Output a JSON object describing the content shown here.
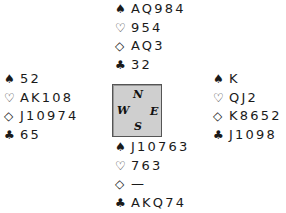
{
  "suits": {
    "spades": "♠",
    "hearts": "♡",
    "diamonds": "◇",
    "clubs": "♣"
  },
  "hands": {
    "north": {
      "spades": "AQ984",
      "hearts": "954",
      "diamonds": "AQ3",
      "clubs": "32"
    },
    "west": {
      "spades": "52",
      "hearts": "AK108",
      "diamonds": "J10974",
      "clubs": "65"
    },
    "east": {
      "spades": "K",
      "hearts": "QJ2",
      "diamonds": "K8652",
      "clubs": "J1098"
    },
    "south": {
      "spades": "J10763",
      "hearts": "763",
      "diamonds": "—",
      "clubs": "AKQ74"
    }
  },
  "compass": {
    "n": "N",
    "w": "W",
    "e": "E",
    "s": "S"
  },
  "colors": {
    "compass_bg": "#cfcfcf",
    "compass_border": "#555555",
    "text": "#1a1a1a"
  }
}
